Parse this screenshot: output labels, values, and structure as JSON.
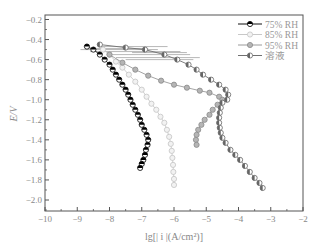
{
  "chart_data": {
    "type": "line",
    "title": "",
    "xlabel": "lg[| i |(A/cm²)]",
    "ylabel": "E/V",
    "xlim": [
      -10,
      -2
    ],
    "ylim": [
      -2.1,
      -0.2
    ],
    "x_ticks": [
      -10,
      -9,
      -8,
      -7,
      -6,
      -5,
      -4,
      -3,
      -2
    ],
    "y_ticks": [
      -0.2,
      -0.4,
      -0.6,
      -0.8,
      -1.0,
      -1.2,
      -1.4,
      -1.6,
      -1.8,
      -2.0
    ],
    "x_tick_labels": [
      "−10",
      "−9",
      "−8",
      "−7",
      "−6",
      "−5",
      "−4",
      "−3",
      "−2"
    ],
    "y_tick_labels": [
      "−0.2",
      "−0.4",
      "−0.6",
      "−0.8",
      "−1.0",
      "−1.2",
      "−1.4",
      "−1.6",
      "−1.8",
      "−2.0"
    ],
    "grid": false,
    "legend_position": "upper right",
    "series": [
      {
        "name": "75% RH",
        "color": "#111111",
        "marker": "half-filled circle (top black)",
        "points": [
          [
            -8.7,
            -0.47
          ],
          [
            -8.5,
            -0.5
          ],
          [
            -8.3,
            -0.55
          ],
          [
            -8.15,
            -0.6
          ],
          [
            -8.0,
            -0.65
          ],
          [
            -7.9,
            -0.7
          ],
          [
            -7.8,
            -0.75
          ],
          [
            -7.7,
            -0.8
          ],
          [
            -7.6,
            -0.85
          ],
          [
            -7.5,
            -0.9
          ],
          [
            -7.42,
            -0.95
          ],
          [
            -7.35,
            -1.0
          ],
          [
            -7.28,
            -1.05
          ],
          [
            -7.2,
            -1.1
          ],
          [
            -7.12,
            -1.15
          ],
          [
            -7.05,
            -1.2
          ],
          [
            -7.0,
            -1.25
          ],
          [
            -6.92,
            -1.3
          ],
          [
            -6.85,
            -1.35
          ],
          [
            -6.8,
            -1.4
          ],
          [
            -6.82,
            -1.45
          ],
          [
            -6.87,
            -1.5
          ],
          [
            -6.9,
            -1.55
          ],
          [
            -6.95,
            -1.6
          ],
          [
            -7.0,
            -1.64
          ],
          [
            -7.05,
            -1.68
          ]
        ]
      },
      {
        "name": "85% RH",
        "color": "#c8c8c8",
        "marker": "open circle",
        "points": [
          [
            -8.2,
            -0.5
          ],
          [
            -8.0,
            -0.55
          ],
          [
            -7.8,
            -0.62
          ],
          [
            -7.6,
            -0.68
          ],
          [
            -7.4,
            -0.75
          ],
          [
            -7.2,
            -0.82
          ],
          [
            -7.0,
            -0.9
          ],
          [
            -6.85,
            -0.97
          ],
          [
            -6.7,
            -1.04
          ],
          [
            -6.55,
            -1.1
          ],
          [
            -6.42,
            -1.17
          ],
          [
            -6.3,
            -1.23
          ],
          [
            -6.22,
            -1.3
          ],
          [
            -6.15,
            -1.37
          ],
          [
            -6.1,
            -1.44
          ],
          [
            -6.07,
            -1.51
          ],
          [
            -6.05,
            -1.58
          ],
          [
            -6.03,
            -1.65
          ],
          [
            -6.02,
            -1.72
          ],
          [
            -6.0,
            -1.79
          ],
          [
            -6.0,
            -1.85
          ]
        ]
      },
      {
        "name": "95% RH",
        "color": "#9a9a9a",
        "marker": "filled gray circle",
        "points": [
          [
            -8.0,
            -0.55
          ],
          [
            -7.6,
            -0.63
          ],
          [
            -7.2,
            -0.7
          ],
          [
            -6.8,
            -0.76
          ],
          [
            -6.4,
            -0.81
          ],
          [
            -6.0,
            -0.85
          ],
          [
            -5.6,
            -0.88
          ],
          [
            -5.2,
            -0.91
          ],
          [
            -4.9,
            -0.93
          ],
          [
            -4.6,
            -0.97
          ],
          [
            -4.5,
            -1.0
          ],
          [
            -4.65,
            -1.05
          ],
          [
            -4.8,
            -1.1
          ],
          [
            -4.9,
            -1.15
          ],
          [
            -5.05,
            -1.2
          ],
          [
            -5.15,
            -1.25
          ],
          [
            -5.25,
            -1.3
          ],
          [
            -5.3,
            -1.35
          ],
          [
            -5.32,
            -1.4
          ],
          [
            -5.3,
            -1.45
          ]
        ]
      },
      {
        "name": "溶液",
        "color": "#707070",
        "marker": "half-filled circle (left dark)",
        "points": [
          [
            -8.3,
            -0.45
          ],
          [
            -7.5,
            -0.48
          ],
          [
            -6.9,
            -0.5
          ],
          [
            -6.3,
            -0.55
          ],
          [
            -5.9,
            -0.6
          ],
          [
            -5.55,
            -0.65
          ],
          [
            -5.3,
            -0.7
          ],
          [
            -5.1,
            -0.75
          ],
          [
            -4.85,
            -0.8
          ],
          [
            -4.6,
            -0.85
          ],
          [
            -4.4,
            -0.9
          ],
          [
            -4.32,
            -0.95
          ],
          [
            -4.35,
            -1.0
          ],
          [
            -4.5,
            -1.03
          ],
          [
            -4.55,
            -1.08
          ],
          [
            -4.58,
            -1.13
          ],
          [
            -4.6,
            -1.18
          ],
          [
            -4.6,
            -1.23
          ],
          [
            -4.58,
            -1.28
          ],
          [
            -4.55,
            -1.33
          ],
          [
            -4.5,
            -1.38
          ],
          [
            -4.4,
            -1.43
          ],
          [
            -4.25,
            -1.5
          ],
          [
            -4.1,
            -1.55
          ],
          [
            -3.95,
            -1.6
          ],
          [
            -3.8,
            -1.66
          ],
          [
            -3.65,
            -1.72
          ],
          [
            -3.5,
            -1.78
          ],
          [
            -3.35,
            -1.83
          ],
          [
            -3.25,
            -1.88
          ]
        ]
      }
    ]
  }
}
